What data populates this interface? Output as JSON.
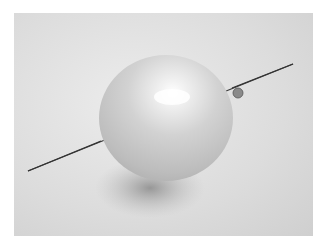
{
  "image": {
    "description": "Black and white photo of a balloon pierced through by a long needle",
    "subjects": [
      "balloon",
      "needle",
      "shadow"
    ],
    "colors": {
      "background": "#dcdcdc",
      "balloon": "#cfcfcf",
      "highlight": "#fafafa",
      "needle": "#333333",
      "shadow": "#9a9a9a"
    }
  }
}
